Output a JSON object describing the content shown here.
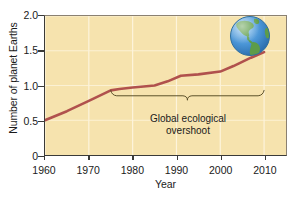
{
  "chart_data": {
    "type": "line",
    "title": "",
    "xlabel": "Year",
    "ylabel": "Number of planet Earths",
    "xlim": [
      1960,
      2015
    ],
    "ylim": [
      0,
      2.0
    ],
    "grid": true,
    "legend": null,
    "x_ticks": [
      1960,
      1970,
      1980,
      1990,
      2000,
      2010
    ],
    "x_tick_labels": [
      "1960",
      "1970",
      "1980",
      "1990",
      "2000",
      "2010"
    ],
    "y_ticks": [
      0,
      0.5,
      1.0,
      1.5,
      2.0
    ],
    "y_tick_labels": [
      "0",
      "0.5",
      "1.0",
      "1.5",
      "2.0"
    ],
    "series": [
      {
        "name": "Humanity's ecological footprint",
        "color": "#b0514d",
        "x": [
          1960,
          1965,
          1970,
          1975,
          1977,
          1980,
          1985,
          1988,
          1991,
          1995,
          2000,
          2003,
          2007,
          2010
        ],
        "values": [
          0.5,
          0.63,
          0.78,
          0.93,
          0.95,
          0.97,
          1.0,
          1.06,
          1.14,
          1.16,
          1.2,
          1.28,
          1.4,
          1.48
        ]
      }
    ],
    "annotations": [
      {
        "name": "global-ecological-overshoot",
        "text_line1": "Global ecological",
        "text_line2": "overshoot",
        "brace_x_start": 1975,
        "brace_x_end": 2010,
        "brace_y": 0.93
      }
    ],
    "images": [
      {
        "name": "earth-globe",
        "description": "Planet Earth globe showing the Americas"
      }
    ],
    "colors": {
      "plot_background": "#f6e3ae",
      "line": "#b0514d",
      "gridline": "#fdf4dc",
      "axis": "#3a3a38",
      "text": "#1a1a1a",
      "globe_ocean": "#4a90d9",
      "globe_land": "#5f9e4a"
    }
  },
  "axes": {
    "y_title": "Number of planet Earths",
    "x_title": "Year"
  }
}
